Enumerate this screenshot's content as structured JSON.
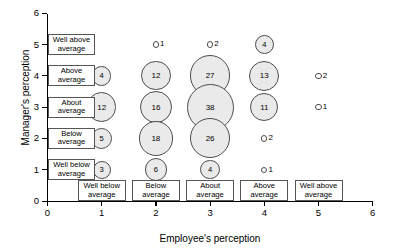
{
  "chart_data": {
    "type": "scatter",
    "title": "",
    "xlabel": "Employee's perception",
    "ylabel": "Manager's perception",
    "xlim": [
      0,
      6
    ],
    "ylim": [
      0,
      6
    ],
    "xticks": [
      "0",
      "1",
      "2",
      "3",
      "4",
      "5",
      "6"
    ],
    "yticks": [
      "0",
      "1",
      "2",
      "3",
      "4",
      "5",
      "6"
    ],
    "grid": false,
    "legend": "none",
    "bubble_value_meaning": "count",
    "x_categories": [
      {
        "x": 1,
        "label_line1": "Well below",
        "label_line2": "average"
      },
      {
        "x": 2,
        "label_line1": "Below",
        "label_line2": "average"
      },
      {
        "x": 3,
        "label_line1": "About",
        "label_line2": "average"
      },
      {
        "x": 4,
        "label_line1": "Above",
        "label_line2": "average"
      },
      {
        "x": 5,
        "label_line1": "Well above",
        "label_line2": "average"
      }
    ],
    "y_categories": [
      {
        "y": 1,
        "label_line1": "Well below",
        "label_line2": "average"
      },
      {
        "y": 2,
        "label_line1": "Below",
        "label_line2": "average"
      },
      {
        "y": 3,
        "label_line1": "About",
        "label_line2": "average"
      },
      {
        "y": 4,
        "label_line1": "Above",
        "label_line2": "average"
      },
      {
        "y": 5,
        "label_line1": "Well above",
        "label_line2": "average"
      }
    ],
    "points": [
      {
        "x": 1,
        "y": 4,
        "value": 4,
        "label_inside": true
      },
      {
        "x": 1,
        "y": 3,
        "value": 12,
        "label_inside": true
      },
      {
        "x": 1,
        "y": 2,
        "value": 5,
        "label_inside": true
      },
      {
        "x": 1,
        "y": 1,
        "value": 3,
        "label_inside": true
      },
      {
        "x": 2,
        "y": 5,
        "value": 1,
        "label_inside": false
      },
      {
        "x": 2,
        "y": 4,
        "value": 12,
        "label_inside": true
      },
      {
        "x": 2,
        "y": 3,
        "value": 16,
        "label_inside": true
      },
      {
        "x": 2,
        "y": 2,
        "value": 18,
        "label_inside": true
      },
      {
        "x": 2,
        "y": 1,
        "value": 6,
        "label_inside": true
      },
      {
        "x": 3,
        "y": 5,
        "value": 2,
        "label_inside": false
      },
      {
        "x": 3,
        "y": 4,
        "value": 27,
        "label_inside": true
      },
      {
        "x": 3,
        "y": 3,
        "value": 38,
        "label_inside": true
      },
      {
        "x": 3,
        "y": 2,
        "value": 26,
        "label_inside": true
      },
      {
        "x": 3,
        "y": 1,
        "value": 4,
        "label_inside": true
      },
      {
        "x": 4,
        "y": 5,
        "value": 4,
        "label_inside": true
      },
      {
        "x": 4,
        "y": 4,
        "value": 13,
        "label_inside": true
      },
      {
        "x": 4,
        "y": 3,
        "value": 11,
        "label_inside": true
      },
      {
        "x": 4,
        "y": 2,
        "value": 2,
        "label_inside": false
      },
      {
        "x": 4,
        "y": 1,
        "value": 1,
        "label_inside": false
      },
      {
        "x": 5,
        "y": 4,
        "value": 2,
        "label_inside": false
      },
      {
        "x": 5,
        "y": 3,
        "value": 1,
        "label_inside": false
      }
    ],
    "colors": {
      "bubble_fill": "#eaeaea",
      "bubble_stroke": "#4d4d4d",
      "axis": "#000000",
      "box_stroke": "#555555",
      "background": "#ffffff"
    }
  }
}
